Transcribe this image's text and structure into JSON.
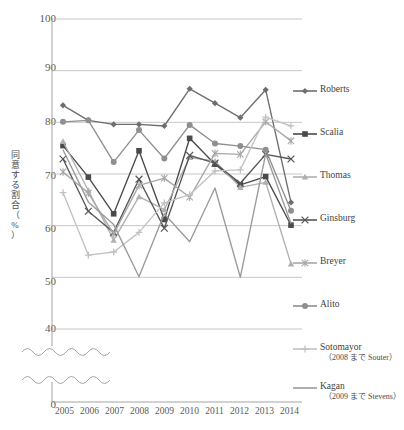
{
  "top_cut_text": "",
  "axis": {
    "y_label": "同意する割合（%）",
    "y_label_chars": [
      "同",
      "意",
      "す",
      "る",
      "割",
      "合",
      "（",
      "%",
      "）"
    ],
    "y_ticks": [
      "100",
      "90",
      "80",
      "70",
      "60",
      "50",
      "40"
    ],
    "y_zero_tick": "0",
    "x_ticks": [
      "2005",
      "2006",
      "2007",
      "2008",
      "2009",
      "2010",
      "2011",
      "2012",
      "2013",
      "2014"
    ],
    "has_break": true,
    "grid": "horizontal"
  },
  "legend": {
    "position": "right",
    "items": [
      {
        "label": "Roberts",
        "sub": "",
        "color": "#6e6e6e",
        "marker": "diamond"
      },
      {
        "label": "Scalia",
        "sub": "",
        "color": "#4a4a4a",
        "marker": "square"
      },
      {
        "label": "Thomas",
        "sub": "",
        "color": "#b0b0b0",
        "marker": "triangle"
      },
      {
        "label": "Ginsburg",
        "sub": "",
        "color": "#555555",
        "marker": "cross-x"
      },
      {
        "label": "Breyer",
        "sub": "",
        "color": "#a8a8a8",
        "marker": "asterisk"
      },
      {
        "label": "Alito",
        "sub": "",
        "color": "#8f8f8f",
        "marker": "circle"
      },
      {
        "label": "Sotomayor",
        "sub": "（2008 まで Souter）",
        "color": "#c2c2c2",
        "marker": "plus"
      },
      {
        "label": "Kagan",
        "sub": "（2009 まで Stevens）",
        "color": "#9a9a9a",
        "marker": "none"
      }
    ]
  },
  "chart_data": {
    "type": "line",
    "title": "",
    "xlabel": "",
    "ylabel": "同意する割合（%）",
    "x": [
      "2005",
      "2006",
      "2007",
      "2008",
      "2009",
      "2010",
      "2011",
      "2012",
      "2013",
      "2014"
    ],
    "ylim": [
      40,
      100
    ],
    "ybreak_to_zero": true,
    "grid": true,
    "legend_position": "right",
    "series": [
      {
        "name": "Roberts",
        "color": "#6e6e6e",
        "marker": "diamond",
        "values": [
          83.3,
          80.4,
          79.6,
          79.6,
          79.3,
          86.5,
          83.7,
          80.9,
          86.3,
          64.5
        ]
      },
      {
        "name": "Scalia",
        "color": "#4a4a4a",
        "marker": "square",
        "values": [
          75.5,
          69.4,
          62.3,
          74.5,
          61.2,
          76.9,
          71.9,
          67.9,
          69.5,
          60.1
        ]
      },
      {
        "name": "Thomas",
        "color": "#b0b0b0",
        "marker": "triangle",
        "values": [
          76.3,
          66.8,
          57.2,
          65.6,
          63.1,
          73.2,
          72.5,
          67.4,
          68.4,
          52.6
        ]
      },
      {
        "name": "Ginsburg",
        "color": "#555555",
        "marker": "cross-x",
        "values": [
          72.9,
          62.8,
          58.7,
          69.0,
          59.5,
          73.6,
          72.1,
          68.2,
          73.8,
          72.9
        ]
      },
      {
        "name": "Breyer",
        "color": "#a8a8a8",
        "marker": "asterisk",
        "values": [
          70.4,
          66.3,
          58.4,
          67.8,
          69.2,
          65.5,
          74.0,
          73.8,
          80.1,
          76.4
        ]
      },
      {
        "name": "Alito",
        "color": "#8f8f8f",
        "marker": "circle",
        "values": [
          80.1,
          80.4,
          72.3,
          78.5,
          73.0,
          79.5,
          75.9,
          75.4,
          74.7,
          62.9
        ]
      },
      {
        "name": "Sotomayor",
        "color": "#c2c2c2",
        "marker": "plus",
        "values": [
          66.4,
          54.3,
          54.9,
          58.7,
          64.4,
          66.0,
          70.6,
          70.8,
          81.0,
          79.3
        ]
      },
      {
        "name": "Kagan",
        "color": "#9a9a9a",
        "marker": "none",
        "values": [
          74.7,
          64.6,
          60.2,
          50.1,
          62.3,
          56.9,
          67.3,
          50.0,
          73.9,
          60.4
        ]
      }
    ]
  }
}
